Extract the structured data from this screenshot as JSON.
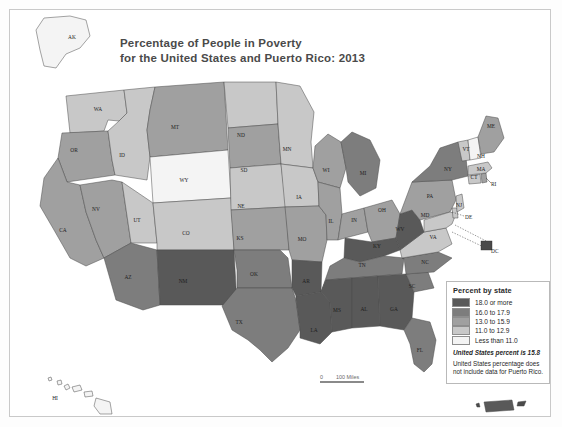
{
  "title": {
    "line1": "Percentage of People in Poverty",
    "line2": "for the United States and Puerto Rico: 2013"
  },
  "legend": {
    "heading": "Percent by state",
    "classes": [
      {
        "label": "18.0 or more",
        "color": "#595959"
      },
      {
        "label": "16.0 to 17.9",
        "color": "#7d7d7d"
      },
      {
        "label": "13.0 to 15.9",
        "color": "#a0a0a0"
      },
      {
        "label": "11.0 to 12.9",
        "color": "#c8c8c8"
      },
      {
        "label": "Less than 11.0",
        "color": "#f4f4f4"
      }
    ],
    "us_percent_note": "United States percent is 15.8",
    "footnote": "United States percentage does not include data for Puerto Rico."
  },
  "scale_bar": {
    "zero": "0",
    "distance": "100 Miles"
  },
  "callouts": {
    "dc": "DC",
    "de": "DE",
    "ri": "RI"
  },
  "chart_data": {
    "type": "choropleth-map",
    "title": "Percentage of People in Poverty for the United States and Puerto Rico: 2013",
    "value_unit": "percent of people in poverty",
    "legend_position": "bottom-right",
    "classes": [
      "18.0 or more",
      "16.0 to 17.9",
      "13.0 to 15.9",
      "11.0 to 12.9",
      "Less than 11.0"
    ],
    "class_colors": [
      "#595959",
      "#7d7d7d",
      "#a0a0a0",
      "#c8c8c8",
      "#f4f4f4"
    ],
    "national_value": 15.8,
    "regions": [
      {
        "code": "AK",
        "class": "Less than 11.0"
      },
      {
        "code": "HI",
        "class": "Less than 11.0"
      },
      {
        "code": "WA",
        "class": "11.0 to 12.9"
      },
      {
        "code": "OR",
        "class": "13.0 to 15.9"
      },
      {
        "code": "ID",
        "class": "11.0 to 12.9"
      },
      {
        "code": "MT",
        "class": "13.0 to 15.9"
      },
      {
        "code": "WY",
        "class": "Less than 11.0"
      },
      {
        "code": "NV",
        "class": "13.0 to 15.9"
      },
      {
        "code": "UT",
        "class": "11.0 to 12.9"
      },
      {
        "code": "CA",
        "class": "13.0 to 15.9"
      },
      {
        "code": "CO",
        "class": "11.0 to 12.9"
      },
      {
        "code": "AZ",
        "class": "16.0 to 17.9"
      },
      {
        "code": "NM",
        "class": "18.0 or more"
      },
      {
        "code": "ND",
        "class": "11.0 to 12.9"
      },
      {
        "code": "SD",
        "class": "13.0 to 15.9"
      },
      {
        "code": "NE",
        "class": "11.0 to 12.9"
      },
      {
        "code": "KS",
        "class": "13.0 to 15.9"
      },
      {
        "code": "OK",
        "class": "16.0 to 17.9"
      },
      {
        "code": "TX",
        "class": "16.0 to 17.9"
      },
      {
        "code": "MN",
        "class": "11.0 to 12.9"
      },
      {
        "code": "IA",
        "class": "11.0 to 12.9"
      },
      {
        "code": "MO",
        "class": "13.0 to 15.9"
      },
      {
        "code": "AR",
        "class": "18.0 or more"
      },
      {
        "code": "LA",
        "class": "18.0 or more"
      },
      {
        "code": "WI",
        "class": "13.0 to 15.9"
      },
      {
        "code": "IL",
        "class": "13.0 to 15.9"
      },
      {
        "code": "MI",
        "class": "16.0 to 17.9"
      },
      {
        "code": "IN",
        "class": "13.0 to 15.9"
      },
      {
        "code": "OH",
        "class": "13.0 to 15.9"
      },
      {
        "code": "KY",
        "class": "18.0 or more"
      },
      {
        "code": "TN",
        "class": "16.0 to 17.9"
      },
      {
        "code": "MS",
        "class": "18.0 or more"
      },
      {
        "code": "AL",
        "class": "18.0 or more"
      },
      {
        "code": "GA",
        "class": "18.0 or more"
      },
      {
        "code": "FL",
        "class": "16.0 to 17.9"
      },
      {
        "code": "SC",
        "class": "16.0 to 17.9"
      },
      {
        "code": "NC",
        "class": "16.0 to 17.9"
      },
      {
        "code": "VA",
        "class": "11.0 to 12.9"
      },
      {
        "code": "WV",
        "class": "18.0 or more"
      },
      {
        "code": "PA",
        "class": "13.0 to 15.9"
      },
      {
        "code": "NY",
        "class": "16.0 to 17.9"
      },
      {
        "code": "MD",
        "class": "11.0 to 12.9"
      },
      {
        "code": "DE",
        "class": "11.0 to 12.9"
      },
      {
        "code": "DC",
        "class": "18.0 or more"
      },
      {
        "code": "NJ",
        "class": "11.0 to 12.9"
      },
      {
        "code": "CT",
        "class": "11.0 to 12.9"
      },
      {
        "code": "RI",
        "class": "13.0 to 15.9"
      },
      {
        "code": "MA",
        "class": "11.0 to 12.9"
      },
      {
        "code": "VT",
        "class": "11.0 to 12.9"
      },
      {
        "code": "NH",
        "class": "Less than 11.0"
      },
      {
        "code": "ME",
        "class": "13.0 to 15.9"
      },
      {
        "code": "PR",
        "class": "18.0 or more"
      }
    ]
  },
  "state_labels": [
    {
      "code": "AK",
      "x": 72,
      "y": 39
    },
    {
      "code": "WA",
      "x": 98,
      "y": 111
    },
    {
      "code": "OR",
      "x": 74,
      "y": 152
    },
    {
      "code": "ID",
      "x": 122,
      "y": 157
    },
    {
      "code": "MT",
      "x": 175,
      "y": 129
    },
    {
      "code": "WY",
      "x": 184,
      "y": 182
    },
    {
      "code": "NV",
      "x": 96,
      "y": 211
    },
    {
      "code": "UT",
      "x": 137,
      "y": 222
    },
    {
      "code": "CA",
      "x": 63,
      "y": 232
    },
    {
      "code": "CO",
      "x": 186,
      "y": 235
    },
    {
      "code": "AZ",
      "x": 128,
      "y": 279
    },
    {
      "code": "NM",
      "x": 183,
      "y": 283
    },
    {
      "code": "ND",
      "x": 241,
      "y": 137
    },
    {
      "code": "SD",
      "x": 244,
      "y": 172
    },
    {
      "code": "NE",
      "x": 241,
      "y": 208
    },
    {
      "code": "KS",
      "x": 240,
      "y": 240
    },
    {
      "code": "OK",
      "x": 254,
      "y": 276
    },
    {
      "code": "TX",
      "x": 239,
      "y": 324
    },
    {
      "code": "MN",
      "x": 287,
      "y": 151
    },
    {
      "code": "IA",
      "x": 299,
      "y": 199
    },
    {
      "code": "MO",
      "x": 302,
      "y": 241
    },
    {
      "code": "AR",
      "x": 306,
      "y": 283
    },
    {
      "code": "LA",
      "x": 314,
      "y": 332
    },
    {
      "code": "WI",
      "x": 326,
      "y": 172
    },
    {
      "code": "IL",
      "x": 331,
      "y": 223
    },
    {
      "code": "MI",
      "x": 363,
      "y": 175
    },
    {
      "code": "IN",
      "x": 354,
      "y": 222
    },
    {
      "code": "OH",
      "x": 382,
      "y": 212
    },
    {
      "code": "KY",
      "x": 377,
      "y": 248
    },
    {
      "code": "TN",
      "x": 362,
      "y": 267
    },
    {
      "code": "MS",
      "x": 337,
      "y": 312
    },
    {
      "code": "AL",
      "x": 364,
      "y": 311
    },
    {
      "code": "GA",
      "x": 394,
      "y": 311
    },
    {
      "code": "FL",
      "x": 420,
      "y": 352
    },
    {
      "code": "SC",
      "x": 412,
      "y": 288
    },
    {
      "code": "NC",
      "x": 425,
      "y": 264
    },
    {
      "code": "VA",
      "x": 433,
      "y": 239
    },
    {
      "code": "WV",
      "x": 400,
      "y": 231
    },
    {
      "code": "PA",
      "x": 430,
      "y": 198
    },
    {
      "code": "NY",
      "x": 448,
      "y": 171
    },
    {
      "code": "MD",
      "x": 425,
      "y": 217
    },
    {
      "code": "NJ",
      "x": 459,
      "y": 207
    },
    {
      "code": "CT",
      "x": 474,
      "y": 179
    },
    {
      "code": "MA",
      "x": 481,
      "y": 171
    },
    {
      "code": "VT",
      "x": 466,
      "y": 151
    },
    {
      "code": "NH",
      "x": 481,
      "y": 158
    },
    {
      "code": "ME",
      "x": 491,
      "y": 128
    },
    {
      "code": "HI",
      "x": 55,
      "y": 400
    }
  ]
}
